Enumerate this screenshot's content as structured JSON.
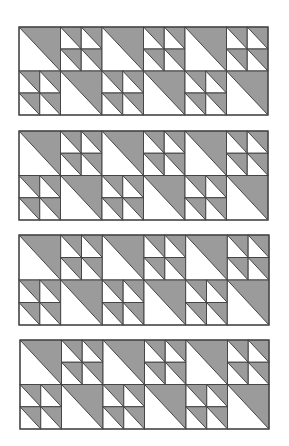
{
  "figure": {
    "colors": {
      "fill": "#9b9b9b",
      "background": "#ffffff",
      "line": "#454545"
    },
    "grid": {
      "cols": 6,
      "rows": 2
    },
    "pattern": [
      [
        "big",
        "quad",
        "big",
        "quad",
        "big",
        "quad"
      ],
      [
        "quad",
        "big",
        "quad",
        "big",
        "quad",
        "big"
      ]
    ],
    "panels": [
      {
        "id": 1,
        "x": 19,
        "y": 27,
        "w": 249,
        "h": 88
      },
      {
        "id": 2,
        "x": 19,
        "y": 131,
        "w": 249,
        "h": 89
      },
      {
        "id": 3,
        "x": 19,
        "y": 235,
        "w": 250,
        "h": 90
      },
      {
        "id": 4,
        "x": 20,
        "y": 340,
        "w": 249,
        "h": 89
      }
    ]
  }
}
